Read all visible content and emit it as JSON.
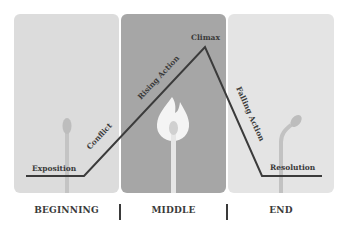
{
  "diagram": {
    "sections": [
      {
        "id": "beginning",
        "label": "BEGINNING",
        "color": "#dcdcdc"
      },
      {
        "id": "middle",
        "label": "MIDDLE",
        "color": "#a6a6a6"
      },
      {
        "id": "end",
        "label": "END",
        "color": "#e3e3e3"
      }
    ],
    "plot_points": {
      "exposition": "Exposition",
      "conflict": "Conflict",
      "rising_action": "Rising Action",
      "climax": "Climax",
      "falling_action": "Falling Action",
      "resolution": "Resolution"
    },
    "line_color": "#3b3b3b",
    "icons": [
      "unlit-match-icon",
      "burning-match-icon",
      "burnt-match-icon"
    ]
  }
}
